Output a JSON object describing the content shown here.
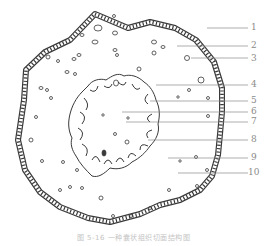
{
  "figure": {
    "caption": "图 5-16  一种囊状组织切面结构图",
    "labels": [
      {
        "n": "1",
        "y": 28,
        "x1": 207
      },
      {
        "n": "2",
        "y": 46,
        "x1": 177
      },
      {
        "n": "3",
        "y": 58,
        "x1": 191
      },
      {
        "n": "4",
        "y": 85,
        "x1": 156
      },
      {
        "n": "5",
        "y": 101,
        "x1": 150
      },
      {
        "n": "6",
        "y": 112,
        "x1": 122
      },
      {
        "n": "7",
        "y": 122,
        "x1": 126
      },
      {
        "n": "8",
        "y": 140,
        "x1": 148
      },
      {
        "n": "9",
        "y": 158,
        "x1": 168
      },
      {
        "n": "10",
        "y": 173,
        "x1": 178
      }
    ],
    "colors": {
      "line": "#3a3a3a",
      "leader": "#8a8a8a",
      "label": "#8a8a8a"
    }
  }
}
